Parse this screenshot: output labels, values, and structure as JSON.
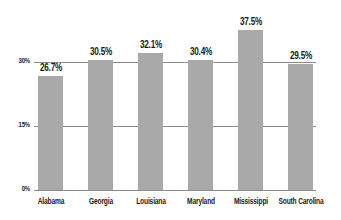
{
  "chart_data": {
    "type": "bar",
    "title": "",
    "xlabel": "",
    "ylabel": "",
    "categories": [
      "Alabama",
      "Georgia",
      "Louisiana",
      "Maryland",
      "Mississippi",
      "South Carolina"
    ],
    "values": [
      26.7,
      30.5,
      32.1,
      30.4,
      37.5,
      29.5
    ],
    "value_labels": [
      "26.7%",
      "30.5%",
      "32.1%",
      "30.4%",
      "37.5%",
      "29.5%"
    ],
    "yticks": [
      0,
      15,
      30
    ],
    "ytick_labels": [
      "0%",
      "15%",
      "30%"
    ],
    "ylim": [
      0,
      40
    ],
    "grid": true,
    "legend": null,
    "colors": {
      "bar": "#a9a9a9",
      "grid": "#8a8a8a",
      "text": "#1a1a1a"
    }
  }
}
